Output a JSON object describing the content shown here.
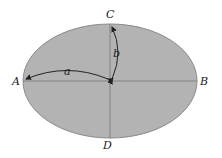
{
  "diagram": {
    "colors": {
      "fill": "#b3b3b3",
      "stroke": "#8a8a8a",
      "axis": "#777777",
      "text": "#222222"
    },
    "points": {
      "A": "A",
      "B": "B",
      "C": "C",
      "D": "D"
    },
    "semi_axes": {
      "a": "a",
      "b": "b"
    }
  }
}
